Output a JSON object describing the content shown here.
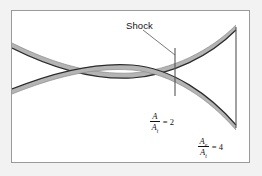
{
  "figure": {
    "type": "converging-diverging-nozzle-with-normal-shock",
    "background_color": "#f2f2f2",
    "panel_color": "#ffffff",
    "frame_color": "#9a9a9a",
    "wall_fill_color": "#b4b4b4",
    "wall_edge_color": "#2b2b2b",
    "line_color": "#555555"
  },
  "annotations": {
    "shock": {
      "label": "Shock",
      "leader": "line from label down-right to shock plane"
    },
    "throat_ratio": {
      "numerator": "A",
      "denominator": "A",
      "denominator_subscript": "t",
      "equals": "= 2",
      "value": 2
    },
    "exit_ratio": {
      "numerator": "A",
      "numerator_subscript": "e",
      "denominator": "A",
      "denominator_subscript": "t",
      "equals": "= 4",
      "value": 4
    }
  }
}
